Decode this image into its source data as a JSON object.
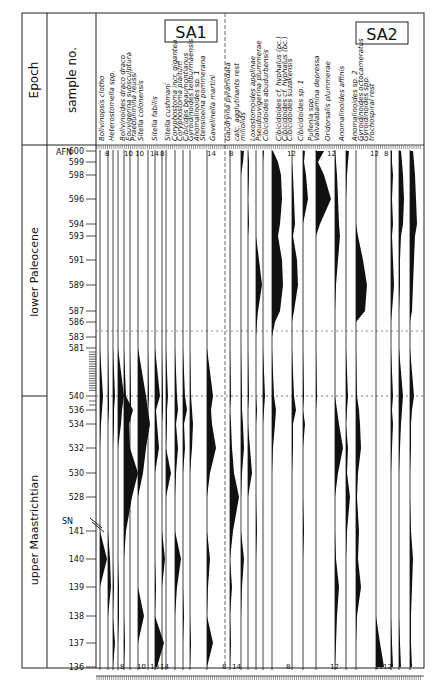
{
  "header": {
    "epoch_label": "Epoch",
    "sample_label": "sample no.",
    "afn_label": "AFN",
    "sn_label": "SN",
    "assemblage_1": "SA1",
    "assemblage_2": "SA2"
  },
  "epochs": [
    {
      "name": "lower Paleocene",
      "from": 600,
      "to": 540
    },
    {
      "name": "upper Maastrichtian",
      "from": 540,
      "to": 136
    }
  ],
  "chart_data": {
    "type": "area",
    "subtype": "foraminiferal abundance range chart (kite diagram, half-width)",
    "title": "",
    "ylabel": "sample no.",
    "xlabel": "",
    "grid": false,
    "legend_position": "none",
    "y_axis": {
      "afn_samples_labeled": [
        600,
        599,
        598,
        596,
        594,
        593,
        591,
        589,
        587,
        586,
        583,
        581,
        540,
        536,
        534,
        532,
        530,
        528
      ],
      "sn_samples_labeled": [
        141,
        140,
        139,
        138,
        137,
        136
      ],
      "boundary": {
        "label": "K/Pg",
        "between": [
          540,
          583
        ]
      }
    },
    "scale_labels_top": [
      "8",
      "10",
      "10",
      "14",
      "8",
      "14",
      "8",
      "12",
      "12",
      "12",
      "8"
    ],
    "scale_labels_bottom": [
      "8",
      "10",
      "10",
      "14",
      "8",
      "14",
      "8",
      "12",
      "12",
      "12"
    ],
    "assemblages": [
      {
        "name": "SA1",
        "species": [
          "Bolivinopsis clotho",
          "Heterostomella spp.",
          "Bolivinoides draco draco",
          "Eouvigerina subsculptura",
          "Praebulimina reussi",
          "Sitella colonensis",
          "Sitella fabilis",
          "Sitella cushmani",
          "Coryphostoma incr. gigantea",
          "Coryphostoma plaitum",
          "Cibicides beaumontianus",
          "Gyroidinoides tellburmaensis",
          "Anomalinoides sp. 1",
          "Stensioeina pommerana",
          "Gavelinella martini"
        ]
      },
      {
        "name": "SA2",
        "species": [
          "Gaudryina pyramidata",
          "calc. agglutinants rest",
          "miliolids",
          "Loxostomoides applinae",
          "Pseudouvigerina plummerae",
          "Cibicidoides abudurbensis",
          "Cibicidoides cf. hyphalus (pc.)",
          "Cibicidoides cf. hyphalus (bc.)",
          "Cibicidoides suzakensis",
          "Cibicidoides sp. 1",
          "Pullenia spp.",
          "Valvalabamina depressa",
          "Oridorsalis plummerae",
          "Anomalinoides affinis",
          "Anomalinoides sp. 2",
          "Gyroidinoides octocameratus",
          "Gyroidinoides spp.",
          "trochospiral rest"
        ]
      }
    ],
    "columns": [
      {
        "x": 100,
        "max": [
          0,
          0,
          0,
          0,
          0,
          0,
          0,
          0,
          0,
          0,
          0,
          0,
          3,
          2,
          1,
          0,
          0,
          0,
          0,
          7,
          0,
          0,
          0,
          0
        ]
      },
      {
        "x": 108,
        "max": [
          0,
          0,
          0,
          0,
          0,
          0,
          0,
          0,
          0,
          0,
          0,
          0,
          1,
          1,
          0,
          0,
          0,
          0,
          0,
          2,
          3,
          0,
          0,
          0
        ]
      },
      {
        "x": 113,
        "max": [
          0,
          0,
          0,
          0,
          0,
          0,
          0,
          0,
          0,
          0,
          0,
          0,
          2,
          1,
          1,
          0,
          0,
          0,
          0,
          0,
          1,
          0,
          2,
          0
        ]
      },
      {
        "x": 118,
        "max": [
          0,
          0,
          0,
          0,
          0,
          0,
          0,
          0,
          0,
          0,
          0,
          0,
          6,
          4,
          3,
          0,
          0,
          0,
          0,
          0,
          1,
          1,
          0,
          0
        ]
      },
      {
        "x": 124,
        "max": [
          0,
          0,
          0,
          0,
          0,
          0,
          0,
          0,
          0,
          0,
          0,
          0,
          2,
          9,
          5,
          6,
          14,
          8,
          2,
          0,
          0,
          0,
          1,
          0
        ]
      },
      {
        "x": 130,
        "max": [
          0,
          0,
          0,
          0,
          0,
          0,
          0,
          0,
          0,
          0,
          0,
          0,
          1,
          1,
          0,
          0,
          0,
          0,
          0,
          0,
          0,
          0,
          0,
          0
        ]
      },
      {
        "x": 138,
        "max": [
          0,
          0,
          0,
          0,
          0,
          0,
          0,
          0,
          0,
          0,
          0,
          0,
          8,
          10,
          12,
          8,
          5,
          0,
          0,
          0,
          0,
          6,
          0,
          0
        ]
      },
      {
        "x": 148,
        "max": [
          0,
          0,
          0,
          0,
          0,
          0,
          0,
          0,
          0,
          0,
          0,
          0,
          1,
          0,
          0,
          0,
          0,
          0,
          0,
          0,
          0,
          0,
          0,
          0
        ]
      },
      {
        "x": 155,
        "max": [
          0,
          0,
          0,
          0,
          0,
          0,
          0,
          0,
          0,
          0,
          0,
          0,
          5,
          1,
          2,
          4,
          0,
          0,
          0,
          0,
          1,
          0,
          9,
          2
        ]
      },
      {
        "x": 162,
        "max": [
          0,
          0,
          0,
          0,
          0,
          0,
          0,
          0,
          0,
          0,
          0,
          0,
          1,
          1,
          0,
          0,
          0,
          0,
          0,
          3,
          0,
          0,
          0,
          0
        ]
      },
      {
        "x": 166,
        "max": [
          0,
          0,
          0,
          0,
          0,
          0,
          0,
          0,
          0,
          0,
          0,
          0,
          2,
          1,
          1,
          0,
          5,
          0,
          0,
          0,
          0,
          0,
          0,
          0
        ]
      },
      {
        "x": 175,
        "max": [
          0,
          0,
          0,
          0,
          0,
          0,
          0,
          0,
          0,
          0,
          0,
          0,
          2,
          3,
          1,
          3,
          1,
          0,
          0,
          6,
          2,
          0,
          0,
          0
        ]
      },
      {
        "x": 183,
        "max": [
          0,
          0,
          0,
          0,
          0,
          0,
          0,
          0,
          0,
          0,
          0,
          0,
          2,
          4,
          1,
          2,
          0,
          0,
          0,
          0,
          0,
          1,
          0,
          0
        ]
      },
      {
        "x": 190,
        "max": [
          0,
          0,
          0,
          0,
          0,
          0,
          0,
          0,
          0,
          0,
          0,
          0,
          1,
          2,
          3,
          2,
          0,
          0,
          0,
          0,
          0,
          0,
          1,
          0
        ]
      },
      {
        "x": 207,
        "max": [
          0,
          0,
          0,
          0,
          0,
          0,
          0,
          0,
          0,
          0,
          0,
          0,
          6,
          4,
          5,
          9,
          3,
          0,
          0,
          3,
          1,
          0,
          6,
          0
        ]
      },
      {
        "x": 230,
        "max": [
          0,
          0,
          0,
          0,
          0,
          0,
          0,
          0,
          0,
          0,
          0,
          0,
          1,
          0,
          1,
          2,
          4,
          9,
          3,
          0,
          2,
          0,
          1,
          0
        ]
      },
      {
        "x": 241,
        "max": [
          3,
          2,
          0,
          0,
          0,
          0,
          0,
          0,
          0,
          0,
          0,
          0,
          1,
          1,
          2,
          3,
          1,
          0,
          0,
          3,
          1,
          0,
          0,
          0
        ]
      },
      {
        "x": 248,
        "max": [
          0,
          1,
          1,
          0,
          1,
          0,
          0,
          0,
          0,
          0,
          0,
          0,
          1,
          0,
          0,
          2,
          4,
          0,
          0,
          0,
          0,
          0,
          0,
          0
        ]
      },
      {
        "x": 256,
        "max": [
          0,
          0,
          0,
          0,
          0,
          0,
          3,
          6,
          2,
          1,
          0,
          0,
          0,
          1,
          0,
          0,
          0,
          0,
          1,
          0,
          0,
          0,
          0,
          0
        ]
      },
      {
        "x": 263,
        "max": [
          1,
          0,
          0,
          0,
          0,
          0,
          0,
          0,
          0,
          0,
          0,
          0,
          2,
          1,
          0,
          0,
          0,
          0,
          0,
          0,
          0,
          0,
          0,
          0
        ]
      },
      {
        "x": 272,
        "max": [
          1,
          6,
          9,
          10,
          8,
          6,
          10,
          11,
          8,
          3,
          0,
          0,
          2,
          4,
          3,
          1,
          0,
          0,
          0,
          0,
          0,
          0,
          0,
          0
        ]
      },
      {
        "x": 292,
        "max": [
          0,
          0,
          1,
          2,
          3,
          1,
          5,
          6,
          2,
          0,
          0,
          0,
          2,
          4,
          1,
          1,
          0,
          0,
          0,
          0,
          0,
          0,
          0,
          0
        ]
      },
      {
        "x": 303,
        "max": [
          2,
          1,
          3,
          5,
          0,
          0,
          0,
          0,
          0,
          0,
          0,
          0,
          1,
          0,
          2,
          0,
          0,
          0,
          1,
          0,
          0,
          0,
          0,
          0
        ]
      },
      {
        "x": 316,
        "max": [
          8,
          2,
          8,
          15,
          4,
          0,
          0,
          0,
          0,
          0,
          0,
          0,
          1,
          0,
          0,
          0,
          0,
          0,
          0,
          0,
          0,
          0,
          0,
          0
        ]
      },
      {
        "x": 335,
        "max": [
          0,
          1,
          2,
          3,
          4,
          5,
          3,
          1,
          0,
          0,
          0,
          0,
          0,
          2,
          4,
          8,
          3,
          0,
          0,
          1,
          4,
          2,
          1,
          0
        ]
      },
      {
        "x": 346,
        "max": [
          3,
          2,
          1,
          0,
          0,
          0,
          0,
          0,
          0,
          0,
          0,
          0,
          2,
          1,
          0,
          2,
          1,
          4,
          1,
          0,
          0,
          0,
          0,
          0
        ]
      },
      {
        "x": 356,
        "max": [
          0,
          0,
          0,
          0,
          0,
          2,
          7,
          11,
          9,
          0,
          0,
          0,
          1,
          3,
          4,
          5,
          2,
          1,
          3,
          2,
          5,
          1,
          0,
          0
        ]
      },
      {
        "x": 376,
        "max": [
          0,
          0,
          0,
          0,
          0,
          0,
          0,
          0,
          0,
          0,
          0,
          0,
          0,
          0,
          0,
          0,
          0,
          0,
          0,
          0,
          0,
          0,
          4,
          8
        ]
      },
      {
        "x": 391,
        "max": [
          1,
          1,
          2,
          1,
          2,
          1,
          2,
          3,
          1,
          0,
          0,
          0,
          2,
          1,
          2,
          1,
          0,
          0,
          0,
          0,
          0,
          0,
          1,
          2
        ]
      },
      {
        "x": 399,
        "max": [
          2,
          3,
          4,
          5,
          4,
          2,
          1,
          1,
          0,
          0,
          0,
          0,
          4,
          3,
          2,
          1,
          0,
          0,
          0,
          0,
          0,
          0,
          1,
          2
        ]
      },
      {
        "x": 410,
        "max": [
          3,
          4,
          5,
          6,
          7,
          5,
          4,
          3,
          2,
          0,
          0,
          0,
          4,
          2,
          1,
          1,
          0,
          0,
          1,
          3,
          2,
          1,
          1,
          2
        ]
      }
    ],
    "row_samples": [
      "600",
      "599",
      "598",
      "596",
      "594",
      "593",
      "591",
      "589",
      "587",
      "586",
      "583",
      "581",
      "540",
      "536",
      "534",
      "532",
      "530",
      "528",
      "141",
      "140",
      "139",
      "138",
      "137",
      "136"
    ]
  }
}
